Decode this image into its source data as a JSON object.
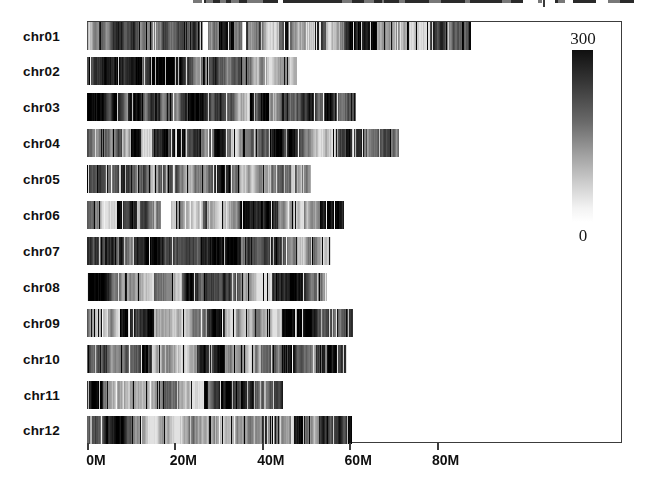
{
  "chart_data": {
    "type": "heatmap",
    "title": "",
    "xlabel": "",
    "ylabel": "",
    "x_unit": "Mb",
    "x_ticks": [
      {
        "label": "0M",
        "mb": 0
      },
      {
        "label": "20M",
        "mb": 20
      },
      {
        "label": "40M",
        "mb": 40
      },
      {
        "label": "60M",
        "mb": 60
      },
      {
        "label": "80M",
        "mb": 80
      }
    ],
    "x_axis_range_mb": [
      0,
      122
    ],
    "grid": false,
    "legend_position": "top-right",
    "colorbar": {
      "max_label": "300",
      "min_label": "0",
      "min": 0,
      "max": 300,
      "low_color": "#ffffff",
      "high_color": "#101010"
    },
    "chromosomes": [
      {
        "name": "chr01",
        "length_mb": 87.9,
        "gaps_mb": [
          [
            26.4,
            27.6
          ],
          [
            35.5,
            36.2
          ]
        ]
      },
      {
        "name": "chr02",
        "length_mb": 48.0,
        "gaps_mb": []
      },
      {
        "name": "chr03",
        "length_mb": 61.5,
        "gaps_mb": []
      },
      {
        "name": "chr04",
        "length_mb": 71.5,
        "gaps_mb": []
      },
      {
        "name": "chr05",
        "length_mb": 51.3,
        "gaps_mb": []
      },
      {
        "name": "chr06",
        "length_mb": 58.9,
        "gaps_mb": [
          [
            16.9,
            19.0
          ]
        ]
      },
      {
        "name": "chr07",
        "length_mb": 55.8,
        "gaps_mb": []
      },
      {
        "name": "chr08",
        "length_mb": 55.0,
        "gaps_mb": []
      },
      {
        "name": "chr09",
        "length_mb": 60.8,
        "gaps_mb": []
      },
      {
        "name": "chr10",
        "length_mb": 59.4,
        "gaps_mb": []
      },
      {
        "name": "chr11",
        "length_mb": 44.8,
        "gaps_mb": []
      },
      {
        "name": "chr12",
        "length_mb": 60.6,
        "gaps_mb": []
      }
    ]
  }
}
